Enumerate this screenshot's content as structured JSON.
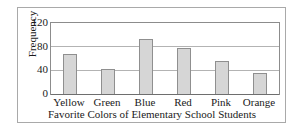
{
  "chart_data": {
    "type": "bar",
    "title": "",
    "xlabel": "Favorite Colors of Elementary School Students",
    "ylabel": "Frequency",
    "categories": [
      "Yellow",
      "Green",
      "Blue",
      "Red",
      "Pink",
      "Orange"
    ],
    "values": [
      68,
      43,
      93,
      77,
      55,
      36
    ],
    "yticks": [
      0,
      40,
      80,
      120
    ],
    "ytick_labels": [
      "0",
      "40",
      "80",
      "120"
    ],
    "ylim": [
      0,
      120
    ],
    "grid": true,
    "legend": null,
    "bar_fill_color": "#d6d6d6",
    "bar_edge_color": "#8f8f8f",
    "axis_color": "#8c8c8c",
    "gridline_color": "#b3b3b3",
    "frame_color": "#a9a9a9",
    "text_color": "#1a1a1a"
  }
}
